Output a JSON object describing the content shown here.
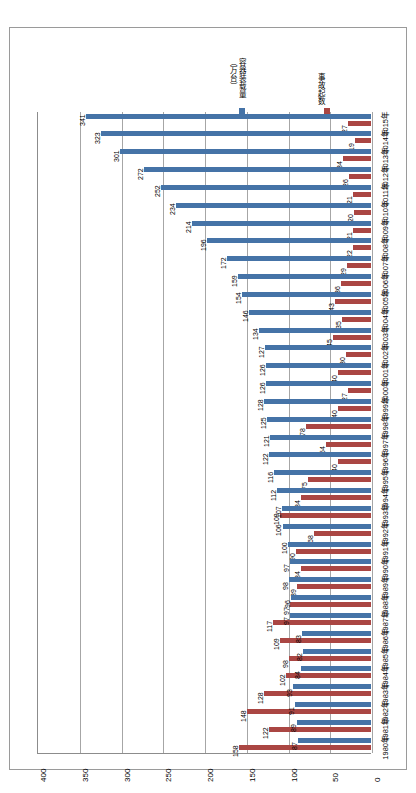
{
  "chart_data": {
    "type": "bar",
    "orientation": "horizontal",
    "title": "",
    "xlabel": "",
    "ylabel": "",
    "xlim": [
      400,
      0
    ],
    "x_reversed": true,
    "xticks": [
      "400",
      "350",
      "300",
      "250",
      "200",
      "150",
      "100",
      "50",
      "0"
    ],
    "grid": true,
    "legend_position": "top-right",
    "categories": [
      "2015年",
      "2014年",
      "2013年",
      "2012年",
      "2011年",
      "2010年",
      "2009年",
      "2008年",
      "2007年",
      "2006年",
      "2005年",
      "2004年",
      "2003年",
      "2002年",
      "2001年",
      "2000年",
      "1999年",
      "1998年",
      "1997年",
      "1996年",
      "1995年",
      "1994年",
      "1993年",
      "1992年",
      "1991年",
      "1990年",
      "1989年",
      "1988年",
      "1987年",
      "1986年",
      "1985年",
      "1984年",
      "1983年",
      "1982年",
      "1981年",
      "1980年"
    ],
    "series": [
      {
        "name": "容器装载量（万台）",
        "color": "#4573a7",
        "values": [
          341,
          323,
          301,
          272,
          252,
          234,
          214,
          196,
          172,
          159,
          154,
          146,
          134,
          127,
          126,
          126,
          128,
          125,
          121,
          122,
          116,
          112,
          107,
          106,
          100,
          97,
          98,
          96,
          97,
          83,
          82,
          84,
          93,
          91,
          89,
          87
        ]
      },
      {
        "name": "事故起数",
        "color": "#aa4643",
        "values": [
          27,
          19,
          34,
          26,
          21,
          20,
          21,
          22,
          29,
          36,
          43,
          35,
          45,
          30,
          40,
          27,
          40,
          78,
          54,
          40,
          75,
          84,
          109,
          68,
          90,
          84,
          89,
          97,
          117,
          109,
          98,
          102,
          128,
          148,
          122,
          158
        ]
      }
    ]
  },
  "legend": {
    "items": [
      {
        "label": "容器装载量（万台）",
        "label_line1": "容器装载量",
        "label_line2": "（万台）",
        "color": "#4573a7"
      },
      {
        "label": "事故起数",
        "label_line1": "事故起数",
        "label_line2": "",
        "color": "#aa4643"
      }
    ]
  }
}
